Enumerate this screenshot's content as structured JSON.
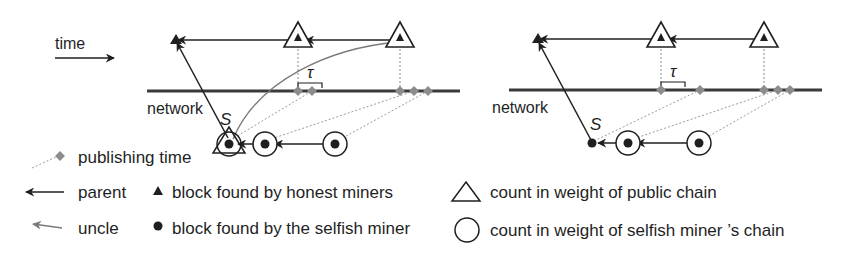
{
  "figure": {
    "type": "selfish-mining-diagram",
    "time_label": "time",
    "network_label": "network",
    "tau_label": "τ",
    "stale_block_label": "S",
    "colors": {
      "ink": "#1f1f1f",
      "publishing_marker": "#8c8c8c",
      "uncle_line": "#7a7a7a",
      "dashed_line": "#9a9a9a"
    }
  },
  "panels": [
    {
      "id": "left",
      "description": "Stale selfish block S counted in both public chain (triangle) and selfish chain (circle)",
      "stale_block_counts": [
        "public",
        "selfish"
      ],
      "honest_blocks": 2,
      "selfish_blocks_circled": 2
    },
    {
      "id": "right",
      "description": "Stale selfish block S not counted in either chain weight",
      "stale_block_counts": [],
      "honest_blocks": 2,
      "selfish_blocks_circled": 2
    }
  ],
  "legend": {
    "publishing_time": "publishing time",
    "parent": "parent",
    "uncle": "uncle",
    "honest_block": "block found by honest miners",
    "selfish_block": "block found by the selfish miner",
    "public_weight": "count in weight of public chain",
    "selfish_weight": "count in weight of selfish miner ’s chain"
  }
}
